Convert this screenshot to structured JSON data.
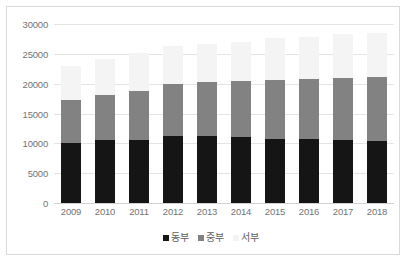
{
  "chart_data": {
    "type": "bar",
    "subtype": "stacked-column",
    "title": "",
    "xlabel": "",
    "ylabel": "",
    "categories": [
      "2009",
      "2010",
      "2011",
      "2012",
      "2013",
      "2014",
      "2015",
      "2016",
      "2017",
      "2018"
    ],
    "series": [
      {
        "name": "동부",
        "color": "#151515",
        "values": [
          10000,
          10500,
          10600,
          11200,
          11300,
          11000,
          10800,
          10700,
          10500,
          10400
        ]
      },
      {
        "name": "중부",
        "color": "#828282",
        "values": [
          7200,
          7600,
          8200,
          8700,
          8900,
          9400,
          9900,
          10100,
          10500,
          10800
        ]
      },
      {
        "name": "서부",
        "color": "#f4f4f4",
        "values": [
          5800,
          6100,
          6300,
          6400,
          6500,
          6600,
          6900,
          7100,
          7400,
          7300
        ]
      }
    ],
    "totals": [
      23000,
      24200,
      25100,
      26300,
      26700,
      27000,
      27600,
      27900,
      28400,
      28500
    ],
    "ylim": [
      0,
      30000
    ],
    "yticks": [
      0,
      5000,
      10000,
      15000,
      20000,
      25000,
      30000
    ],
    "ytick_labels": [
      "0",
      "5000",
      "10000",
      "15000",
      "20000",
      "25000",
      "30000"
    ],
    "grid": true,
    "legend_position": "bottom",
    "legend": [
      "동부",
      "중부",
      "서부"
    ]
  },
  "colors": {
    "frame_border": "#d9d9d9",
    "gridline": "#e4e4e4",
    "axis_text": "#737373",
    "legend_text": "#5e5e5e",
    "background": "#ffffff"
  }
}
